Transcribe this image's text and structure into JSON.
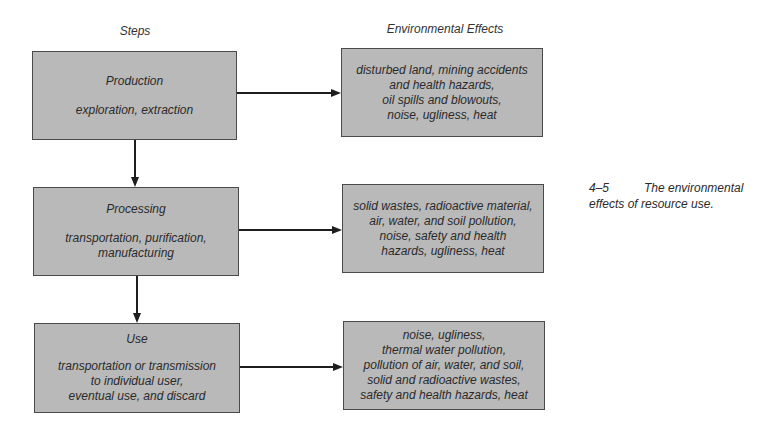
{
  "headers": {
    "steps": "Steps",
    "effects": "Environmental Effects"
  },
  "steps": [
    {
      "title": "Production",
      "description": "exploration, extraction"
    },
    {
      "title": "Processing",
      "description": "transportation, purification,\nmanufacturing"
    },
    {
      "title": "Use",
      "description": "transportation or transmission\nto individual user,\neventual use, and discard"
    }
  ],
  "effects": [
    {
      "text": "disturbed land, mining accidents\nand health hazards,\noil spills and blowouts,\nnoise, ugliness, heat"
    },
    {
      "text": "solid wastes, radioactive material,\nair, water, and soil pollution,\nnoise, safety and health\nhazards, ugliness, heat"
    },
    {
      "text": "noise, ugliness,\nthermal water pollution,\npollution of air, water, and soil,\nsolid and radioactive wastes,\nsafety and health hazards, heat"
    }
  ],
  "caption": {
    "number": "4–5",
    "text_line1": "The environmental",
    "text_line2": "effects of resource use."
  },
  "colors": {
    "box_fill": "#b9b9b9",
    "box_border": "#4a4a4a",
    "arrow": "#1e1e1e"
  }
}
